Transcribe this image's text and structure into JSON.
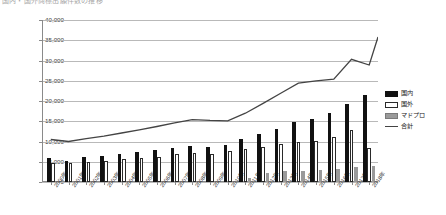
{
  "title": {
    "text": "国内・国外商標出願件数の推移",
    "clipped": true
  },
  "legend": {
    "position": "right",
    "items": [
      {
        "label": "国内",
        "key": "domestic",
        "color": "#111111",
        "style": "filled-bar"
      },
      {
        "label": "国外",
        "key": "foreign",
        "color": "#ffffff",
        "style": "outline-bar"
      },
      {
        "label": "マドプロ",
        "key": "madrid",
        "color": "#9a9a9a",
        "style": "gray-bar"
      },
      {
        "label": "合計",
        "key": "total",
        "color": "#444444",
        "style": "line"
      }
    ]
  },
  "chart_data": {
    "type": "bar",
    "title": "国内・国外商標出願件数の推移",
    "xlabel": "",
    "ylabel": "",
    "ylim": [
      0,
      40000
    ],
    "ytick_step": 5000,
    "grid": true,
    "legend_position": "right",
    "categories": [
      "2000年",
      "2001年",
      "2002年",
      "2003年",
      "2004年",
      "2005年",
      "2006年",
      "2007年",
      "2008年",
      "2009年",
      "2010年",
      "2011年",
      "2012年",
      "2013年",
      "2014年",
      "2015年",
      "2016年",
      "2017年",
      "2018年"
    ],
    "ytick_labels": [
      "0",
      "5,000",
      "10,000",
      "15,000",
      "20,000",
      "25,000",
      "30,000",
      "35,000",
      "40,000"
    ],
    "series": [
      {
        "name": "国内",
        "type": "bar",
        "color": "#111111",
        "values": [
          6000,
          5200,
          6200,
          6500,
          7000,
          7500,
          8000,
          8400,
          8800,
          8600,
          9200,
          10500,
          11800,
          13200,
          14800,
          15500,
          17000,
          19300,
          21600
        ]
      },
      {
        "name": "国外",
        "type": "bar",
        "color": "#ffffff",
        "values": [
          4800,
          4600,
          5000,
          5200,
          5600,
          5900,
          6300,
          6800,
          7200,
          7000,
          7600,
          8200,
          8700,
          9300,
          9900,
          10200,
          11000,
          12800,
          8300
        ]
      },
      {
        "name": "マドプロ",
        "type": "bar",
        "color": "#9a9a9a",
        "values": [
          0,
          0,
          0,
          0,
          0,
          0,
          0,
          0,
          0,
          0,
          0,
          900,
          2200,
          2600,
          2800,
          3000,
          3300,
          3700,
          4000
        ]
      },
      {
        "name": "合計",
        "type": "line",
        "color": "#444444",
        "values": [
          10500,
          10000,
          10700,
          11300,
          12100,
          12900,
          13700,
          14600,
          15400,
          15200,
          15100,
          17000,
          19400,
          21900,
          24400,
          25000,
          25400,
          30300,
          28900
        ]
      }
    ],
    "line_overlay_values": [
      10500,
      10000,
      10700,
      11300,
      12100,
      12900,
      13700,
      14600,
      15400,
      15200,
      15100,
      17000,
      19400,
      21900,
      24400,
      25000,
      25400,
      30300,
      28900,
      35800
    ]
  }
}
